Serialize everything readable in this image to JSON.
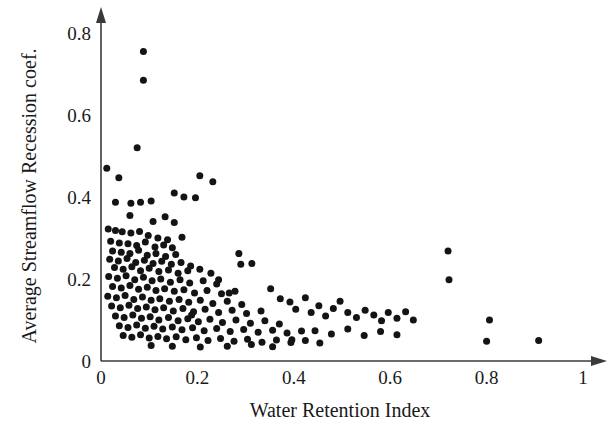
{
  "chart_data": {
    "type": "scatter",
    "title": "",
    "xlabel": "Water Retention Index",
    "ylabel": "Average Streamflow Recession coef.",
    "xlim": [
      0,
      1
    ],
    "ylim": [
      0,
      0.8
    ],
    "grid": false,
    "legend": null,
    "marker": {
      "shape": "circle",
      "color": "#141414",
      "size_px": 7
    },
    "xticks": [
      {
        "value": 0,
        "label": "0"
      },
      {
        "value": 0.2,
        "label": "0.2"
      },
      {
        "value": 0.4,
        "label": "0.4"
      },
      {
        "value": 0.6,
        "label": "0.6"
      },
      {
        "value": 0.8,
        "label": "0.8"
      },
      {
        "value": 1,
        "label": "1"
      }
    ],
    "yticks": [
      {
        "value": 0,
        "label": "0"
      },
      {
        "value": 0.2,
        "label": "0.2"
      },
      {
        "value": 0.4,
        "label": "0.4"
      },
      {
        "value": 0.6,
        "label": "0.6"
      },
      {
        "value": 0.8,
        "label": "0.8"
      }
    ],
    "points": [
      [
        0.088,
        0.755
      ],
      [
        0.088,
        0.685
      ],
      [
        0.075,
        0.52
      ],
      [
        0.012,
        0.47
      ],
      [
        0.037,
        0.447
      ],
      [
        0.205,
        0.452
      ],
      [
        0.232,
        0.437
      ],
      [
        0.152,
        0.41
      ],
      [
        0.172,
        0.4
      ],
      [
        0.196,
        0.398
      ],
      [
        0.03,
        0.387
      ],
      [
        0.062,
        0.385
      ],
      [
        0.082,
        0.387
      ],
      [
        0.104,
        0.39
      ],
      [
        0.06,
        0.355
      ],
      [
        0.133,
        0.352
      ],
      [
        0.108,
        0.34
      ],
      [
        0.152,
        0.338
      ],
      [
        0.015,
        0.322
      ],
      [
        0.03,
        0.318
      ],
      [
        0.044,
        0.315
      ],
      [
        0.062,
        0.312
      ],
      [
        0.08,
        0.316
      ],
      [
        0.098,
        0.306
      ],
      [
        0.118,
        0.3
      ],
      [
        0.138,
        0.296
      ],
      [
        0.168,
        0.302
      ],
      [
        0.02,
        0.292
      ],
      [
        0.038,
        0.288
      ],
      [
        0.056,
        0.286
      ],
      [
        0.074,
        0.282
      ],
      [
        0.092,
        0.29
      ],
      [
        0.112,
        0.278
      ],
      [
        0.13,
        0.283
      ],
      [
        0.148,
        0.276
      ],
      [
        0.024,
        0.268
      ],
      [
        0.042,
        0.265
      ],
      [
        0.06,
        0.262
      ],
      [
        0.078,
        0.27
      ],
      [
        0.096,
        0.258
      ],
      [
        0.114,
        0.262
      ],
      [
        0.134,
        0.255
      ],
      [
        0.155,
        0.26
      ],
      [
        0.018,
        0.248
      ],
      [
        0.036,
        0.244
      ],
      [
        0.054,
        0.25
      ],
      [
        0.072,
        0.24
      ],
      [
        0.09,
        0.246
      ],
      [
        0.108,
        0.238
      ],
      [
        0.126,
        0.243
      ],
      [
        0.146,
        0.236
      ],
      [
        0.166,
        0.24
      ],
      [
        0.186,
        0.232
      ],
      [
        0.028,
        0.228
      ],
      [
        0.046,
        0.224
      ],
      [
        0.064,
        0.23
      ],
      [
        0.082,
        0.22
      ],
      [
        0.1,
        0.226
      ],
      [
        0.12,
        0.218
      ],
      [
        0.14,
        0.222
      ],
      [
        0.16,
        0.214
      ],
      [
        0.18,
        0.22
      ],
      [
        0.205,
        0.224
      ],
      [
        0.228,
        0.214
      ],
      [
        0.016,
        0.206
      ],
      [
        0.034,
        0.202
      ],
      [
        0.052,
        0.208
      ],
      [
        0.07,
        0.198
      ],
      [
        0.088,
        0.204
      ],
      [
        0.106,
        0.196
      ],
      [
        0.124,
        0.2
      ],
      [
        0.144,
        0.192
      ],
      [
        0.164,
        0.198
      ],
      [
        0.184,
        0.19
      ],
      [
        0.212,
        0.196
      ],
      [
        0.24,
        0.188
      ],
      [
        0.024,
        0.182
      ],
      [
        0.042,
        0.178
      ],
      [
        0.06,
        0.184
      ],
      [
        0.078,
        0.175
      ],
      [
        0.096,
        0.18
      ],
      [
        0.114,
        0.172
      ],
      [
        0.132,
        0.176
      ],
      [
        0.152,
        0.17
      ],
      [
        0.172,
        0.174
      ],
      [
        0.194,
        0.166
      ],
      [
        0.22,
        0.172
      ],
      [
        0.25,
        0.164
      ],
      [
        0.278,
        0.17
      ],
      [
        0.014,
        0.158
      ],
      [
        0.032,
        0.154
      ],
      [
        0.05,
        0.16
      ],
      [
        0.068,
        0.15
      ],
      [
        0.086,
        0.156
      ],
      [
        0.104,
        0.148
      ],
      [
        0.122,
        0.152
      ],
      [
        0.142,
        0.146
      ],
      [
        0.162,
        0.15
      ],
      [
        0.182,
        0.143
      ],
      [
        0.206,
        0.148
      ],
      [
        0.232,
        0.14
      ],
      [
        0.262,
        0.146
      ],
      [
        0.292,
        0.138
      ],
      [
        0.022,
        0.134
      ],
      [
        0.04,
        0.13
      ],
      [
        0.058,
        0.136
      ],
      [
        0.076,
        0.128
      ],
      [
        0.094,
        0.132
      ],
      [
        0.112,
        0.125
      ],
      [
        0.13,
        0.13
      ],
      [
        0.15,
        0.122
      ],
      [
        0.17,
        0.128
      ],
      [
        0.192,
        0.12
      ],
      [
        0.216,
        0.126
      ],
      [
        0.244,
        0.118
      ],
      [
        0.272,
        0.124
      ],
      [
        0.302,
        0.116
      ],
      [
        0.332,
        0.122
      ],
      [
        0.03,
        0.11
      ],
      [
        0.048,
        0.106
      ],
      [
        0.066,
        0.112
      ],
      [
        0.084,
        0.104
      ],
      [
        0.102,
        0.108
      ],
      [
        0.12,
        0.1
      ],
      [
        0.14,
        0.106
      ],
      [
        0.16,
        0.098
      ],
      [
        0.18,
        0.103
      ],
      [
        0.202,
        0.096
      ],
      [
        0.226,
        0.102
      ],
      [
        0.252,
        0.094
      ],
      [
        0.28,
        0.1
      ],
      [
        0.31,
        0.092
      ],
      [
        0.34,
        0.098
      ],
      [
        0.37,
        0.09
      ],
      [
        0.038,
        0.086
      ],
      [
        0.056,
        0.082
      ],
      [
        0.074,
        0.088
      ],
      [
        0.092,
        0.08
      ],
      [
        0.11,
        0.085
      ],
      [
        0.128,
        0.078
      ],
      [
        0.148,
        0.083
      ],
      [
        0.168,
        0.076
      ],
      [
        0.19,
        0.081
      ],
      [
        0.214,
        0.074
      ],
      [
        0.24,
        0.079
      ],
      [
        0.268,
        0.072
      ],
      [
        0.296,
        0.077
      ],
      [
        0.326,
        0.07
      ],
      [
        0.356,
        0.075
      ],
      [
        0.386,
        0.068
      ],
      [
        0.416,
        0.073
      ],
      [
        0.046,
        0.062
      ],
      [
        0.064,
        0.058
      ],
      [
        0.082,
        0.064
      ],
      [
        0.1,
        0.056
      ],
      [
        0.118,
        0.06
      ],
      [
        0.136,
        0.054
      ],
      [
        0.156,
        0.059
      ],
      [
        0.176,
        0.052
      ],
      [
        0.198,
        0.057
      ],
      [
        0.222,
        0.05
      ],
      [
        0.248,
        0.055
      ],
      [
        0.276,
        0.048
      ],
      [
        0.304,
        0.053
      ],
      [
        0.334,
        0.046
      ],
      [
        0.364,
        0.051
      ],
      [
        0.394,
        0.045
      ],
      [
        0.424,
        0.05
      ],
      [
        0.454,
        0.044
      ],
      [
        0.286,
        0.262
      ],
      [
        0.29,
        0.236
      ],
      [
        0.313,
        0.238
      ],
      [
        0.352,
        0.176
      ],
      [
        0.372,
        0.152
      ],
      [
        0.392,
        0.144
      ],
      [
        0.404,
        0.126
      ],
      [
        0.424,
        0.154
      ],
      [
        0.436,
        0.118
      ],
      [
        0.452,
        0.135
      ],
      [
        0.466,
        0.11
      ],
      [
        0.482,
        0.128
      ],
      [
        0.496,
        0.146
      ],
      [
        0.512,
        0.118
      ],
      [
        0.53,
        0.106
      ],
      [
        0.548,
        0.124
      ],
      [
        0.566,
        0.112
      ],
      [
        0.582,
        0.098
      ],
      [
        0.596,
        0.118
      ],
      [
        0.614,
        0.104
      ],
      [
        0.632,
        0.12
      ],
      [
        0.648,
        0.1
      ],
      [
        0.444,
        0.074
      ],
      [
        0.478,
        0.066
      ],
      [
        0.512,
        0.078
      ],
      [
        0.546,
        0.062
      ],
      [
        0.58,
        0.072
      ],
      [
        0.614,
        0.064
      ],
      [
        0.72,
        0.268
      ],
      [
        0.722,
        0.198
      ],
      [
        0.806,
        0.1
      ],
      [
        0.8,
        0.048
      ],
      [
        0.908,
        0.05
      ],
      [
        0.396,
        0.052
      ],
      [
        0.356,
        0.035
      ],
      [
        0.262,
        0.036
      ],
      [
        0.206,
        0.034
      ],
      [
        0.148,
        0.036
      ],
      [
        0.104,
        0.038
      ],
      [
        0.312,
        0.04
      ],
      [
        0.188,
        0.112
      ],
      [
        0.244,
        0.198
      ],
      [
        0.266,
        0.166
      ]
    ]
  }
}
